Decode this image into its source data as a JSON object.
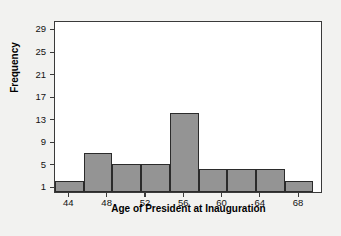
{
  "chart_data": {
    "type": "bar",
    "title": "",
    "xlabel": "Age of President at Inauguration",
    "ylabel": "Frequency",
    "categories": [
      "42.5-45.5",
      "45.5-48.5",
      "48.5-51.5",
      "51.5-54.5",
      "54.5-57.5",
      "57.5-60.5",
      "60.5-63.5",
      "63.5-66.5",
      "66.5-69.5"
    ],
    "bins": [
      {
        "start": 42.5,
        "end": 45.5,
        "value": 2
      },
      {
        "start": 45.5,
        "end": 48.5,
        "value": 7
      },
      {
        "start": 48.5,
        "end": 51.5,
        "value": 5
      },
      {
        "start": 51.5,
        "end": 54.5,
        "value": 5
      },
      {
        "start": 54.5,
        "end": 57.5,
        "value": 14
      },
      {
        "start": 57.5,
        "end": 60.5,
        "value": 4
      },
      {
        "start": 60.5,
        "end": 63.5,
        "value": 4
      },
      {
        "start": 63.5,
        "end": 66.5,
        "value": 4
      },
      {
        "start": 66.5,
        "end": 69.5,
        "value": 2
      }
    ],
    "values": [
      2,
      7,
      5,
      5,
      14,
      4,
      4,
      4,
      2
    ],
    "xlim": [
      42.5,
      70.5
    ],
    "ylim": [
      0,
      30.5
    ],
    "x_ticks": [
      "44",
      "48",
      "52",
      "56",
      "60",
      "64",
      "68"
    ],
    "x_tick_values": [
      44,
      48,
      52,
      56,
      60,
      64,
      68
    ],
    "y_ticks": [
      "1",
      "5",
      "9",
      "13",
      "17",
      "21",
      "25",
      "29"
    ],
    "y_tick_values": [
      1,
      5,
      9,
      13,
      17,
      21,
      25,
      29
    ],
    "grid": false,
    "legend": null,
    "bar_fill_color": "#949494",
    "bar_border_color": "#2b2b2b",
    "plot_background": "#ffffff",
    "page_background": "#f2f2f0",
    "axis_color": "#3a3a3a"
  }
}
